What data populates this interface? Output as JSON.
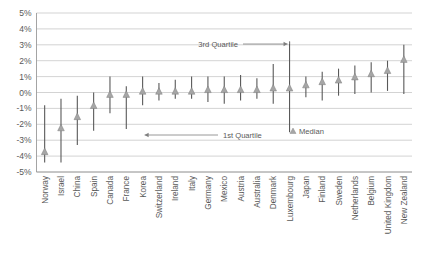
{
  "chart_data": {
    "type": "line",
    "title": "",
    "subtitle": "",
    "xlabel": "",
    "ylabel": "",
    "ylim": [
      -5,
      5
    ],
    "ytick_labels": [
      "5%",
      "4%",
      "3%",
      "2%",
      "1%",
      "0%",
      "-1%",
      "-2%",
      "-3%",
      "-4%",
      "-5%"
    ],
    "ytick_values": [
      5,
      4,
      3,
      2,
      1,
      0,
      -1,
      -2,
      -3,
      -4,
      -5
    ],
    "grid": true,
    "legend_position": "inside-center",
    "categories": [
      "Norway",
      "Israel",
      "China",
      "Spain",
      "Canada",
      "France",
      "Korea",
      "Switzerland",
      "Ireland",
      "Italy",
      "Germany",
      "Mexico",
      "Austria",
      "Australia",
      "Denmark",
      "Luxembourg",
      "Japan",
      "Finland",
      "Sweden",
      "Netherlands",
      "Belgium",
      "United Kingdom",
      "New Zealand"
    ],
    "series": [
      {
        "name": "Median",
        "values": [
          -3.7,
          -2.2,
          -1.5,
          -0.8,
          -0.1,
          -0.1,
          0.1,
          0.1,
          0.1,
          0.1,
          0.2,
          0.2,
          0.2,
          0.2,
          0.3,
          0.3,
          0.5,
          0.7,
          0.8,
          1.0,
          1.2,
          1.4,
          2.1
        ]
      },
      {
        "name": "1st Quartile",
        "values": [
          -4.4,
          -4.4,
          -3.3,
          -2.4,
          -1.3,
          -2.3,
          -0.8,
          -0.5,
          -0.4,
          -0.4,
          -0.6,
          -0.7,
          -0.5,
          -0.4,
          -0.7,
          -2.5,
          -0.3,
          -0.5,
          -0.2,
          -0.1,
          0.0,
          0.1,
          -0.1
        ]
      },
      {
        "name": "3rd Quartile",
        "values": [
          -0.8,
          -0.4,
          -0.2,
          0.0,
          1.0,
          0.4,
          1.0,
          0.6,
          0.8,
          1.0,
          1.0,
          1.0,
          1.1,
          0.9,
          1.8,
          3.2,
          1.0,
          1.3,
          1.5,
          1.7,
          1.9,
          2.0,
          3.0
        ]
      }
    ],
    "annotations": [
      {
        "id": "third-quartile",
        "label": "3rd Quartile",
        "target_category": "Luxembourg",
        "target_value": 3.2,
        "arrow": "right"
      },
      {
        "id": "first-quartile",
        "label": "1st Quartile",
        "target_category": "Korea",
        "target_value": -2.4,
        "arrow": "left"
      }
    ],
    "legend": [
      {
        "label": "Median",
        "marker": "triangle-up",
        "color": "#a6a6a6"
      }
    ],
    "colors": {
      "marker": "#a6a6a6",
      "marker_stroke": "#7f7f7f",
      "whisker": "#595959",
      "gridline": "#c8c8c8",
      "axis": "#9a9a9a",
      "text": "#595959",
      "background": "#ffffff"
    }
  }
}
